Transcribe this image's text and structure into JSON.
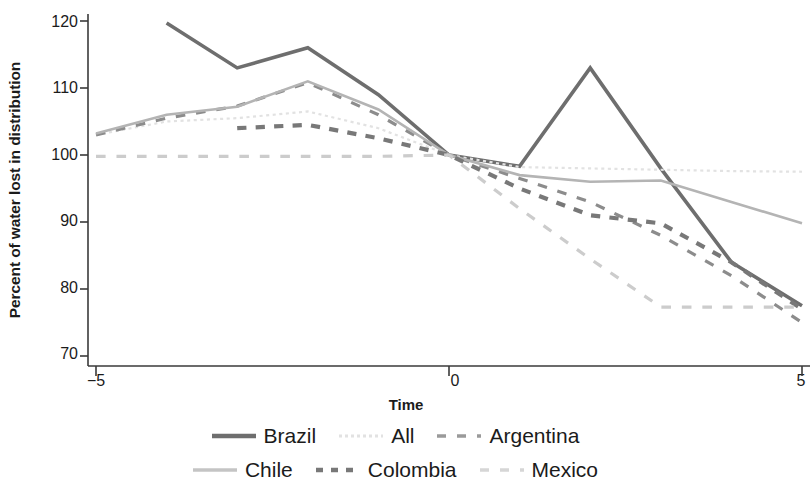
{
  "chart_data": {
    "type": "line",
    "title": "",
    "xlabel": "Time",
    "ylabel": "Percent of water lost in distribution",
    "x": [
      -5,
      -4,
      -3,
      -2,
      -1,
      0,
      1,
      2,
      3,
      4,
      5
    ],
    "xlim": [
      -5,
      5
    ],
    "ylim": [
      66,
      122
    ],
    "xticks": [
      -5,
      0,
      5
    ],
    "xtick_labels": [
      "−5",
      "0",
      "5"
    ],
    "yticks": [
      70,
      80,
      90,
      100,
      110,
      120
    ],
    "ytick_labels": [
      "70",
      "80",
      "90",
      "100",
      "110",
      "120"
    ],
    "grid": false,
    "legend_position": "bottom",
    "series": [
      {
        "name": "Brazil",
        "color": "#6e6e6e",
        "style": "solid",
        "width": 3.6,
        "x": [
          -4,
          -3,
          -2,
          -1,
          0,
          1,
          2,
          3,
          4,
          5
        ],
        "values": [
          119.7,
          113.0,
          116.0,
          109.0,
          100.0,
          98.3,
          113.0,
          98.0,
          84.0,
          77.5
        ]
      },
      {
        "name": "All",
        "color": "#e2e2e2",
        "style": "dotted",
        "width": 2.2,
        "x": [
          -5,
          -4,
          -3,
          -2,
          -1,
          0,
          1,
          2,
          3,
          4,
          5
        ],
        "values": [
          103.0,
          105.0,
          105.5,
          106.5,
          104.0,
          100.0,
          98.2,
          98.0,
          97.8,
          97.6,
          97.5
        ]
      },
      {
        "name": "Argentina",
        "color": "#8c8c8c",
        "style": "dashed",
        "width": 3.2,
        "x": [
          -5,
          -4,
          -3,
          -2,
          -1,
          0,
          1,
          2,
          3,
          4,
          5
        ],
        "values": [
          103.0,
          105.5,
          107.3,
          110.8,
          106.0,
          100.0,
          96.5,
          93.0,
          88.0,
          82.0,
          75.0
        ]
      },
      {
        "name": "Chile",
        "color": "#b4b4b4",
        "style": "solid",
        "width": 2.6,
        "x": [
          -5,
          -4,
          -3,
          -2,
          -1,
          0,
          1,
          2,
          3,
          4,
          5
        ],
        "values": [
          103.2,
          106.0,
          107.2,
          111.0,
          106.8,
          100.0,
          97.0,
          96.0,
          96.2,
          93.0,
          89.8
        ]
      },
      {
        "name": "Colombia",
        "color": "#787878",
        "style": "dashed-thick",
        "width": 4.2,
        "x": [
          -3,
          -2,
          -1,
          0,
          1,
          2,
          3,
          4,
          5
        ],
        "values": [
          104.0,
          104.5,
          102.5,
          100.0,
          95.0,
          91.0,
          89.8,
          84.0,
          77.0
        ]
      },
      {
        "name": "Mexico",
        "color": "#cccccc",
        "style": "dashed",
        "width": 3.2,
        "x": [
          -5,
          -4,
          -3,
          -2,
          -1,
          0,
          1,
          2,
          3,
          4,
          5
        ],
        "values": [
          99.8,
          99.8,
          99.8,
          99.8,
          99.8,
          100.0,
          92.0,
          84.5,
          77.3,
          77.3,
          77.3
        ]
      }
    ]
  },
  "axis": {
    "ylabel": "Percent of water lost in distribution",
    "xlabel": "Time",
    "ytick_0": "120",
    "ytick_1": "110",
    "ytick_2": "100",
    "ytick_3": "90",
    "ytick_4": "80",
    "ytick_5": "70",
    "xtick_0": "−5",
    "xtick_1": "0",
    "xtick_2": "5"
  },
  "legend": {
    "row1": [
      {
        "label": "Brazil",
        "icon": "line-swatch-solid-dark"
      },
      {
        "label": "All",
        "icon": "line-swatch-dotted-light"
      },
      {
        "label": "Argentina",
        "icon": "line-swatch-dashed-medium"
      }
    ],
    "row2": [
      {
        "label": "Chile",
        "icon": "line-swatch-solid-light"
      },
      {
        "label": "Colombia",
        "icon": "line-swatch-dashed-dark"
      },
      {
        "label": "Mexico",
        "icon": "line-swatch-dashed-pale"
      }
    ]
  }
}
